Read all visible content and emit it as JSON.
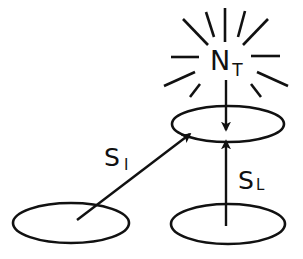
{
  "diagram": {
    "type": "flow-diagram",
    "colors": {
      "stroke": "#111111",
      "background": "#ffffff"
    },
    "nodes": [
      {
        "id": "top-patch",
        "shape": "ellipse",
        "cx": 228,
        "cy": 124,
        "rx": 57,
        "ry": 18
      },
      {
        "id": "left-patch",
        "shape": "ellipse",
        "cx": 71,
        "cy": 223,
        "rx": 58,
        "ry": 20
      },
      {
        "id": "right-patch",
        "shape": "ellipse",
        "cx": 228,
        "cy": 224,
        "rx": 57,
        "ry": 20
      }
    ],
    "source": {
      "id": "burst",
      "label_main": "N",
      "label_sub": "T",
      "ray_count": 12
    },
    "edges": [
      {
        "from": "burst",
        "to": "top-patch",
        "label_main": "",
        "label_sub": ""
      },
      {
        "from": "left-patch",
        "to": "top-patch",
        "label_main": "S",
        "label_sub": "I"
      },
      {
        "from": "right-patch",
        "to": "top-patch",
        "label_main": "S",
        "label_sub": "L"
      }
    ]
  },
  "labels": {
    "nt_main": "N",
    "nt_sub": "T",
    "si_main": "S",
    "si_sub": "I",
    "sl_main": "S",
    "sl_sub": "L"
  }
}
